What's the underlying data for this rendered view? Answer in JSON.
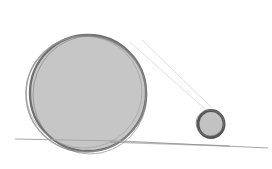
{
  "scene": {
    "description": "Pencil sketch of a large circle and a small circle resting on a ground line",
    "colors": {
      "background": "#ffffff",
      "fill": "#c4c4c4",
      "stroke": "#6e6e6e",
      "ground": "#9a9a9a",
      "guide_lines": "#d0d0d0"
    },
    "large_circle": {
      "cx": 88,
      "cy": 93,
      "r": 58
    },
    "small_circle": {
      "cx": 211,
      "cy": 124,
      "r": 13
    },
    "ground_line": {
      "x1": 15,
      "y1": 139,
      "x2": 268,
      "y2": 148
    }
  }
}
